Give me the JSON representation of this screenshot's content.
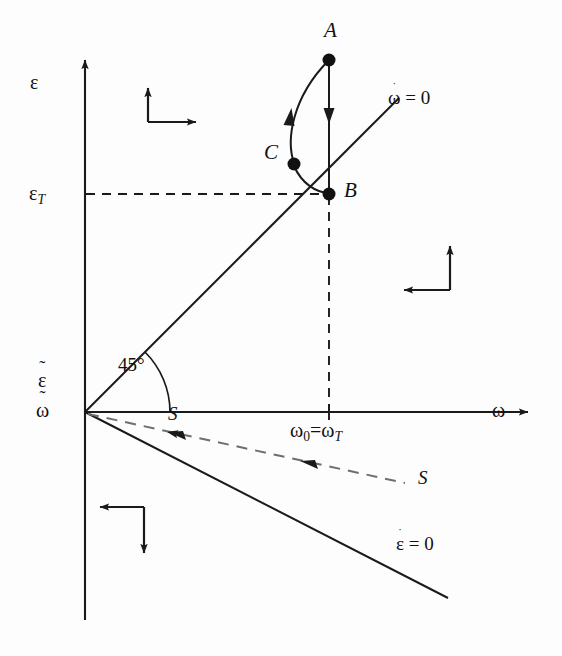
{
  "figure": {
    "type": "phase-plane-diagram",
    "background_color": "#fdfdfd",
    "line_color": "#1a1a1a",
    "width": 562,
    "height": 656
  },
  "axes": {
    "y_axis_label": "ε",
    "x_axis_label": "ω",
    "y_threshold_label": "ε",
    "y_threshold_subscript": "T",
    "origin_label_top": "ε",
    "origin_label_top_accent": "˜",
    "origin_label_bottom": "ω",
    "origin_label_bottom_accent": "˜",
    "x_tick_label_first": "ω",
    "x_tick_label_first_subscript": "0",
    "x_tick_label_equals": "=",
    "x_tick_label_second": "ω",
    "x_tick_label_second_subscript": "T",
    "origin_x": 85,
    "origin_y": 412
  },
  "nullclines": [
    {
      "name": "omega-dot-nullcline",
      "label_base": "ω",
      "label_accent": "̇",
      "label_rest": "= 0",
      "style": "solid",
      "angle_label": "45°",
      "from": [
        85,
        412
      ],
      "to": [
        399,
        98
      ]
    },
    {
      "name": "epsilon-dot-nullcline",
      "label_base": "ε",
      "label_accent": "̇",
      "label_rest": "= 0",
      "style": "solid",
      "from": [
        85,
        412
      ],
      "to": [
        448,
        598
      ]
    }
  ],
  "separatrix": {
    "name": "S",
    "label": "S",
    "style": "dashed",
    "from": [
      85,
      412
    ],
    "to": [
      405,
      482
    ],
    "arrow_direction": "toward-origin",
    "label_near_origin": "S",
    "label_far": "S"
  },
  "points": [
    {
      "id": "A",
      "label": "A",
      "x": 329,
      "y": 60
    },
    {
      "id": "B",
      "label": "B",
      "x": 329,
      "y": 194
    },
    {
      "id": "C",
      "label": "C",
      "x": 294,
      "y": 164
    }
  ],
  "trajectory": {
    "segments": [
      {
        "from": "A",
        "to": "B",
        "shape": "straight-vertical",
        "arrow": "down"
      },
      {
        "from": "B",
        "to": "C",
        "shape": "arc",
        "arrow": "none"
      },
      {
        "from": "C",
        "to": "A",
        "shape": "arc",
        "arrow": "up"
      }
    ]
  },
  "quadrant_markers": [
    {
      "name": "upper-left-marker",
      "vertical": "up",
      "horizontal": "right",
      "x": 148,
      "y": 85
    },
    {
      "name": "right-marker",
      "vertical": "up",
      "horizontal": "left",
      "x": 425,
      "y": 245
    },
    {
      "name": "lower-left-marker",
      "vertical": "down",
      "horizontal": "left",
      "x": 100,
      "y": 500
    }
  ],
  "threshold_lines": [
    {
      "name": "epsilon-T-horizontal-dashed",
      "from": [
        85,
        194
      ],
      "to": [
        329,
        194
      ]
    },
    {
      "name": "omega-0-vertical-dashed",
      "from": [
        329,
        194
      ],
      "to": [
        329,
        412
      ]
    }
  ]
}
